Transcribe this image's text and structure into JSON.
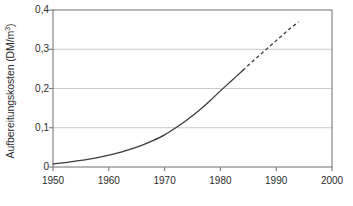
{
  "chart_data": {
    "type": "line",
    "title": "",
    "xlabel": "",
    "ylabel": "Aufbereitungskosten (DM/m³)",
    "ylabel_text": "Aufbereitungskosten (DM/m",
    "ylabel_sup": "3",
    "ylabel_tail": ")",
    "xlim": [
      1950,
      2000
    ],
    "ylim": [
      0,
      0.4
    ],
    "grid": "horizontal",
    "legend": "none",
    "x_tick_labels": [
      "1950",
      "1960",
      "1970",
      "1980",
      "1990",
      "2000"
    ],
    "x_tick_values": [
      1950,
      1960,
      1970,
      1980,
      1990,
      2000
    ],
    "y_tick_labels": [
      "0",
      "0,1",
      "0,2",
      "0,3",
      "0,4"
    ],
    "y_tick_values": [
      0,
      0.1,
      0.2,
      0.3,
      0.4
    ],
    "series": [
      {
        "name": "Aufbereitungskosten (gemessen)",
        "style": "solid",
        "x": [
          1950,
          1952,
          1954,
          1956,
          1958,
          1960,
          1962,
          1964,
          1966,
          1968,
          1970,
          1972,
          1974,
          1976,
          1978,
          1980,
          1982,
          1984
        ],
        "values": [
          0.008,
          0.011,
          0.015,
          0.019,
          0.024,
          0.03,
          0.037,
          0.046,
          0.056,
          0.068,
          0.082,
          0.1,
          0.12,
          0.142,
          0.167,
          0.194,
          0.22,
          0.246
        ]
      },
      {
        "name": "Aufbereitungskosten (Prognose)",
        "style": "dashed",
        "x": [
          1984,
          1986,
          1988,
          1990,
          1992,
          1994
        ],
        "values": [
          0.246,
          0.272,
          0.297,
          0.322,
          0.347,
          0.37
        ]
      }
    ],
    "annotations": [
      {
        "label": "0,1 erreicht",
        "x": 1971,
        "y": 0.1
      },
      {
        "label": "0,2 erreicht",
        "x": 1981,
        "y": 0.2
      }
    ],
    "colors": {
      "curve": "#3b3b3b",
      "gridline": "#c9c9c9",
      "axis": "#6e6e6e",
      "text": "#2b2b2b",
      "background": "#ffffff"
    }
  }
}
